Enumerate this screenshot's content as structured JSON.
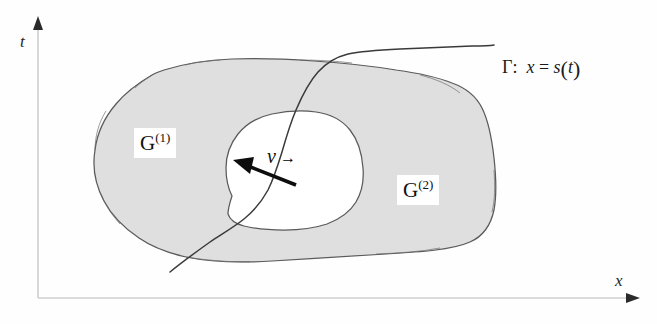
{
  "figure": {
    "background_color": "#fefefe",
    "blob_fill_color": "#dfdfdf",
    "blob_stroke_color": "#555555",
    "axis_color": "#cfcfcf",
    "ink_color": "#1b1b1b"
  },
  "axes": {
    "vertical": {
      "label": "t",
      "arrow": "up-arrow-icon"
    },
    "horizontal": {
      "label": "x",
      "arrow": "right-arrow-icon"
    }
  },
  "regions": [
    {
      "id": "g1",
      "base": "G",
      "superscript": "(1)"
    },
    {
      "id": "g2",
      "base": "G",
      "superscript": "(2)"
    }
  ],
  "interface": {
    "symbol": "Γ",
    "separator": ":",
    "equation_lhs": "x",
    "equation_rel": "=",
    "equation_fn": "s",
    "equation_open": "(",
    "equation_arg": "t",
    "equation_close": ")",
    "full_label": "Γ:  x = s(t)"
  },
  "vector": {
    "label": "v",
    "accent": "→",
    "full_label": "v⃗",
    "description": "normal velocity arrow"
  }
}
